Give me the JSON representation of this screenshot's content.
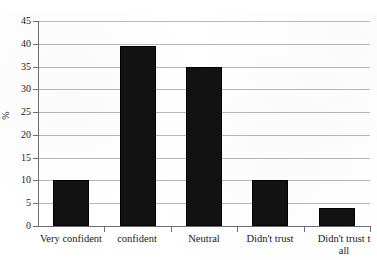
{
  "title_ghost": "…  …  … … …",
  "chart_data": {
    "type": "bar",
    "title": "",
    "xlabel": "",
    "ylabel": "%",
    "ylim": [
      0,
      45
    ],
    "ytick_step": 5,
    "ytick_labels": [
      "45",
      "40",
      "35",
      "30",
      "25",
      "20",
      "15",
      "10",
      "5",
      "0"
    ],
    "grid": true,
    "legend": "none",
    "categories": [
      "Very confident",
      "confident",
      "Neutral",
      "Didn't trust",
      "Didn't trust t\nall"
    ],
    "values": [
      10,
      39.5,
      35,
      10,
      4
    ],
    "bar_color": "#121212",
    "gridline_color": "#b9b9bd",
    "axis_color": "#6e6e72",
    "background_color": "#ffffff"
  }
}
